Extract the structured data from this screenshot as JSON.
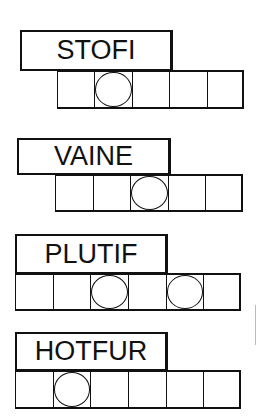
{
  "puzzles": [
    {
      "scrambled": "STOFI",
      "letters": 5,
      "circled": [
        1
      ],
      "label_box": {
        "x": 20,
        "y": 30,
        "w": 153,
        "h": 41
      },
      "cells_box": {
        "x": 57,
        "y": 70,
        "w": 187,
        "h": 39
      }
    },
    {
      "scrambled": "VAINE",
      "letters": 5,
      "circled": [
        2
      ],
      "label_box": {
        "x": 17,
        "y": 138,
        "w": 154,
        "h": 37
      },
      "cells_box": {
        "x": 55,
        "y": 174,
        "w": 188,
        "h": 38
      }
    },
    {
      "scrambled": "PLUTIF",
      "letters": 6,
      "circled": [
        2,
        4
      ],
      "label_box": {
        "x": 15,
        "y": 234,
        "w": 153,
        "h": 40
      },
      "cells_box": {
        "x": 15,
        "y": 273,
        "w": 226,
        "h": 38
      }
    },
    {
      "scrambled": "HOTFUR",
      "letters": 6,
      "circled": [
        1
      ],
      "label_box": {
        "x": 15,
        "y": 332,
        "w": 153,
        "h": 39
      },
      "cells_box": {
        "x": 15,
        "y": 370,
        "w": 226,
        "h": 39
      }
    }
  ],
  "colors": {
    "ink": "#111111",
    "paper": "#ffffff"
  }
}
